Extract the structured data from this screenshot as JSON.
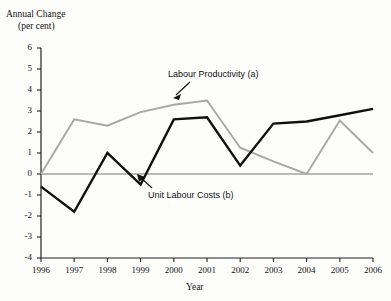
{
  "chart_data": {
    "type": "line",
    "title": "",
    "ylabel_line1": "Annual Change",
    "ylabel_line2": "(per cent)",
    "xlabel": "Year",
    "categories": [
      1996,
      1997,
      1998,
      1999,
      2000,
      2001,
      2002,
      2003,
      2004,
      2005,
      2006
    ],
    "xtick_labels": [
      "1996",
      "1997",
      "1998",
      "1999",
      "2000",
      "2001",
      "2002",
      "2003",
      "2004",
      "2005",
      "2006"
    ],
    "ytick_labels": [
      "6",
      "5",
      "4",
      "3",
      "2",
      "1",
      "0",
      "-1",
      "-2",
      "-3",
      "-4"
    ],
    "ytick_values": [
      6,
      5,
      4,
      3,
      2,
      1,
      0,
      -1,
      -2,
      -3,
      -4
    ],
    "ylim": [
      -4,
      6
    ],
    "xlim": [
      1996,
      2006
    ],
    "grid": false,
    "legend_position": "inline-annotations",
    "zero_line": true,
    "series": [
      {
        "name": "Labour Productivity (a)",
        "color": "#a8a8a8",
        "values": [
          0.0,
          2.6,
          2.3,
          2.95,
          3.3,
          3.5,
          1.25,
          0.6,
          0.0,
          2.55,
          1.0
        ]
      },
      {
        "name": "Unit Labour Costs (b)",
        "color": "#101010",
        "values": [
          -0.6,
          -1.8,
          1.0,
          -0.5,
          2.6,
          2.7,
          0.4,
          2.4,
          2.5,
          2.8,
          3.1
        ]
      }
    ],
    "annotations": [
      {
        "label": "Labour Productivity (a)",
        "points_to_year": 2001,
        "points_to_value": 3.5
      },
      {
        "label": "Unit Labour Costs (b)",
        "points_to_year": 1999,
        "points_to_value": -0.5
      }
    ]
  }
}
